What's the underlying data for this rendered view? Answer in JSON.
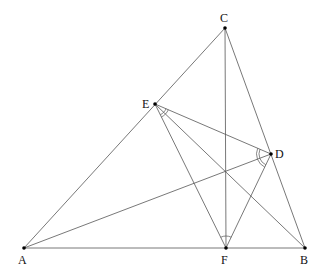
{
  "diagram": {
    "type": "geometry-triangle-orthic",
    "stroke_color": "#555555",
    "point_color": "#000000",
    "points": [
      {
        "id": "A",
        "label": "A",
        "x": 24,
        "y": 248,
        "lx": 18,
        "ly": 264
      },
      {
        "id": "B",
        "label": "B",
        "x": 305,
        "y": 248,
        "lx": 300,
        "ly": 264
      },
      {
        "id": "C",
        "label": "C",
        "x": 225,
        "y": 28,
        "lx": 220,
        "ly": 22
      },
      {
        "id": "D",
        "label": "D",
        "x": 271,
        "y": 154,
        "lx": 275,
        "ly": 158
      },
      {
        "id": "E",
        "label": "E",
        "x": 155,
        "y": 104,
        "lx": 142,
        "ly": 108
      },
      {
        "id": "F",
        "label": "F",
        "x": 226,
        "y": 248,
        "lx": 221,
        "ly": 264
      }
    ],
    "segments": [
      [
        "A",
        "B"
      ],
      [
        "A",
        "C"
      ],
      [
        "B",
        "C"
      ],
      [
        "C",
        "F"
      ],
      [
        "A",
        "D"
      ],
      [
        "B",
        "E"
      ],
      [
        "E",
        "D"
      ],
      [
        "E",
        "F"
      ],
      [
        "D",
        "F"
      ]
    ],
    "angle_marks": [
      {
        "vertex": "E",
        "between": [
          "F",
          "B"
        ],
        "arcs": 2
      },
      {
        "vertex": "E",
        "between": [
          "B",
          "D"
        ],
        "arcs": 2
      },
      {
        "vertex": "D",
        "between": [
          "E",
          "A"
        ],
        "arcs": 2
      },
      {
        "vertex": "D",
        "between": [
          "A",
          "F"
        ],
        "arcs": 2
      },
      {
        "vertex": "F",
        "between": [
          "E",
          "C"
        ],
        "arcs": 1
      },
      {
        "vertex": "F",
        "between": [
          "C",
          "D"
        ],
        "arcs": 1
      }
    ]
  }
}
